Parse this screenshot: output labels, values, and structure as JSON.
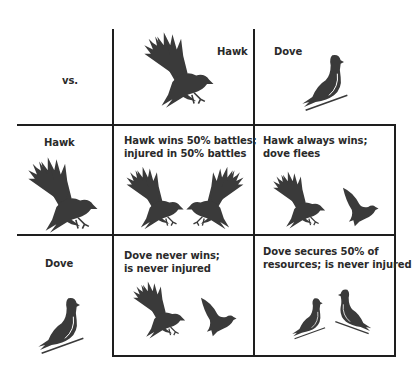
{
  "matrix": {
    "corner": "vs.",
    "col_headers": [
      "Hawk",
      "Dove"
    ],
    "row_headers": [
      "Hawk",
      "Dove"
    ],
    "cells": {
      "hawk_hawk": {
        "line1": "Hawk wins 50% battles;",
        "line2": "injured in 50% battles"
      },
      "hawk_dove": {
        "line1": "Hawk always wins;",
        "line2": "dove flees"
      },
      "dove_hawk": {
        "line1": "Dove never wins;",
        "line2": "is never injured"
      },
      "dove_dove": {
        "line1": "Dove secures 50% of",
        "line2": "resources; is never injured"
      }
    }
  },
  "colors": {
    "ink": "#3a3a3a",
    "grid": "#1e1e1e",
    "background": "#ffffff"
  },
  "icons": [
    "hawk-icon",
    "dove-icon"
  ]
}
